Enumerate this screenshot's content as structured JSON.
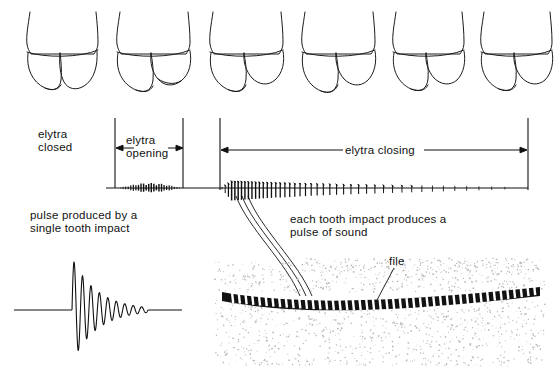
{
  "figure": {
    "ink_color": "#111111",
    "background_color": "#ffffff"
  },
  "labels": {
    "elytra_closed": "elytra\ncloased",
    "elytra_closed_text": "elytra\nclosed",
    "elytra_opening": "elytra\nopening",
    "elytra_closing": "elytra closing",
    "pulse_single": "pulse produced by a\nsingle tooth impact",
    "each_tooth": "each tooth impact produces a\npulse of sound",
    "file": "file"
  },
  "phase_markers": {
    "line_x": [
      115,
      183,
      220,
      528
    ],
    "line_top": 118,
    "line_bottom": 188,
    "opening_arrow": {
      "x1": 115,
      "x2": 183,
      "y": 148
    },
    "closing_arrow": {
      "x1": 220,
      "x2": 528,
      "y": 150
    }
  },
  "beetle_drawings": {
    "count": 6,
    "caption": "abdomen with elytra in six successive positions",
    "centers_x": [
      62,
      152,
      245,
      337,
      428,
      516
    ],
    "top_y": 8,
    "height": 100
  },
  "chart_data": {
    "type": "line",
    "xlabel": "",
    "ylabel": "",
    "traces": [
      {
        "name": "opening-burst",
        "description": "low amplitude dense burst during elytra opening",
        "x_start": 118,
        "x_end": 182,
        "peak_amplitude": 5,
        "spike_count": 26
      },
      {
        "name": "closing-burst",
        "description": "series of discrete tooth-impact pulses during elytra closing, amplitude and density decreasing to the right",
        "x_start": 222,
        "x_end": 506,
        "peak_amplitude": 11,
        "spike_count": 44
      }
    ],
    "baseline_y": 188,
    "baseline_x_start": 106,
    "baseline_x_end": 528,
    "single_pulse": {
      "name": "single-tooth-pulse",
      "description": "damped sinusoidal oscillation produced by one tooth impact",
      "baseline_y": 310,
      "x_start": 14,
      "x_end": 182,
      "onset_x": 72,
      "cycles": 9,
      "peak_amplitude": 52,
      "decay": "exponential"
    }
  },
  "file_illustration": {
    "name": "stridulatory file",
    "tooth_count": 46,
    "band_color": "#121212",
    "stipple_color": "#b9b9b9",
    "leader_lines": 3,
    "leader_from_waveform_x": [
      236,
      242,
      248
    ],
    "leader_to_file_x": [
      300,
      306,
      312
    ]
  }
}
